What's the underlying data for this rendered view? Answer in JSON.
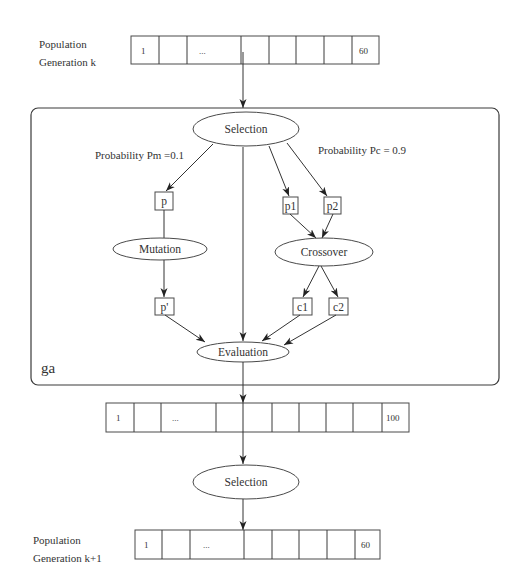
{
  "diagram": {
    "frame_label": "ga",
    "top_population": {
      "label_line1": "Population",
      "label_line2": "Generation k",
      "cells": [
        "1",
        "",
        "...",
        "",
        "",
        "",
        "",
        "60"
      ]
    },
    "intermediate_population": {
      "cells": [
        "1",
        "",
        "...",
        "",
        "",
        "",
        "",
        "",
        "",
        "100"
      ]
    },
    "bottom_population": {
      "label_line1": "Population",
      "label_line2": "Generation k+1",
      "cells": [
        "1",
        "",
        "...",
        "",
        "",
        "",
        "",
        "60"
      ]
    },
    "nodes": {
      "selection_inner": "Selection",
      "mutation": "Mutation",
      "crossover": "Crossover",
      "evaluation": "Evaluation",
      "selection_outer": "Selection",
      "p": "p",
      "p_prime": "p'",
      "p1": "p1",
      "p2": "p2",
      "c1": "c1",
      "c2": "c2"
    },
    "edge_labels": {
      "mutation_probability": "Probability Pm =0.1",
      "crossover_probability": "Probability Pc = 0.9"
    },
    "colors": {
      "line": "#333333",
      "text": "#333333",
      "background": "#ffffff"
    }
  }
}
